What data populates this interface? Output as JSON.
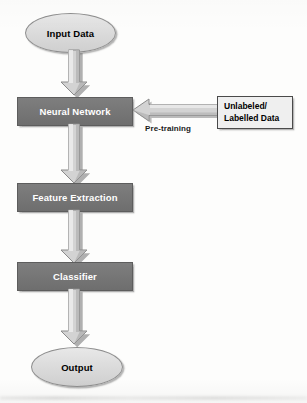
{
  "diagram": {
    "type": "flowchart",
    "orientation": "top-to-bottom",
    "nodes": [
      {
        "id": "input",
        "label": "Input Data",
        "shape": "ellipse",
        "fill": "#dcdcdc",
        "text_color": "#000000"
      },
      {
        "id": "nn",
        "label": "Neural Network",
        "shape": "rectangle",
        "fill": "#767676",
        "text_color": "#ffffff"
      },
      {
        "id": "feature",
        "label": "Feature Extraction",
        "shape": "rectangle",
        "fill": "#767676",
        "text_color": "#ffffff"
      },
      {
        "id": "classifier",
        "label": "Classifier",
        "shape": "rectangle",
        "fill": "#767676",
        "text_color": "#ffffff"
      },
      {
        "id": "output",
        "label": "Output",
        "shape": "ellipse",
        "fill": "#dcdcdc",
        "text_color": "#000000"
      },
      {
        "id": "data",
        "label_line1": "Unlabeled/",
        "label_line2": "Labelled Data",
        "shape": "rectangle",
        "fill": "#efefef",
        "text_color": "#000000"
      }
    ],
    "edges": [
      {
        "from": "input",
        "to": "nn",
        "label": "",
        "direction": "down"
      },
      {
        "from": "nn",
        "to": "feature",
        "label": "",
        "direction": "down"
      },
      {
        "from": "feature",
        "to": "classifier",
        "label": "",
        "direction": "down"
      },
      {
        "from": "classifier",
        "to": "output",
        "label": "",
        "direction": "down"
      },
      {
        "from": "data",
        "to": "nn",
        "label": "Pre-training",
        "direction": "left"
      }
    ],
    "edge_labels": {
      "pretraining": "Pre-training"
    }
  }
}
